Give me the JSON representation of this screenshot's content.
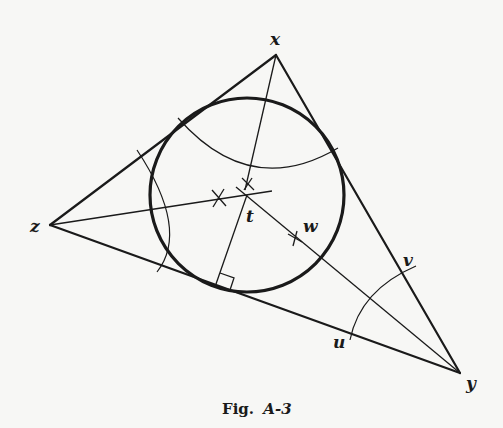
{
  "figure": {
    "caption_prefix": "Fig.",
    "caption_id": "A-3",
    "labels": {
      "x": "x",
      "y": "y",
      "z": "z",
      "t": "t",
      "w": "w",
      "u": "u",
      "v": "v"
    },
    "colors": {
      "ink": "#1a1a1a",
      "background": "#f7f7f5"
    }
  }
}
